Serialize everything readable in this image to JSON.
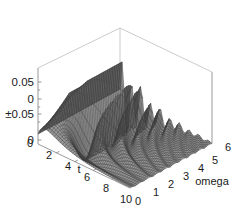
{
  "chart_data": {
    "type": "line",
    "render_style": "3d-surface-wireframe",
    "title": "",
    "subtitle": "",
    "xlabel": "t",
    "ylabel": "omega",
    "zlabel": "",
    "xlim": [
      0,
      10
    ],
    "ylim": [
      0,
      6
    ],
    "zlim": [
      -0.075,
      0.075
    ],
    "grid": false,
    "legend": null,
    "legend_position": "none",
    "background_color": "#ffffff",
    "mesh_color": "#4a4a4a",
    "frame_color": "#6f6f6f",
    "text_color": "#1a1a1a",
    "x_ticks": [
      0,
      2,
      4,
      6,
      8,
      10
    ],
    "x_tick_labels": [
      "0",
      "2",
      "4",
      "6",
      "8",
      "10"
    ],
    "y_ticks": [
      0,
      1,
      2,
      3,
      4,
      5,
      6
    ],
    "y_tick_labels": [
      "0",
      "1",
      "2",
      "3",
      "4",
      "5",
      "6"
    ],
    "z_ticks": [
      0.05,
      0,
      -0.05,
      -0.1
    ],
    "z_tick_labels": [
      "0.05",
      "0",
      "±0.05",
      "0"
    ],
    "surface_description": "Damped oscillatory surface f(t,omega): amplitude decays with t and oscillation frequency increases with omega",
    "surface_model": {
      "formula": "amp(t) * sin(omega * t * k)",
      "decay": 0.38,
      "freq_scale": 1.0,
      "peak_amplitude": 0.075,
      "t_samples": 46,
      "omega_samples": 46
    },
    "annotations": []
  },
  "axes": {
    "z": {
      "name": "vertical-value-axis",
      "ticks": [
        "0.05",
        "0",
        "±0.05",
        "0"
      ]
    },
    "t": {
      "name": "t-axis",
      "label": "t",
      "ticks": [
        "0",
        "2",
        "4",
        "6",
        "8",
        "10"
      ]
    },
    "omega": {
      "name": "omega-axis",
      "label": "omega",
      "ticks": [
        "0",
        "1",
        "2",
        "3",
        "4",
        "5",
        "6"
      ]
    }
  }
}
